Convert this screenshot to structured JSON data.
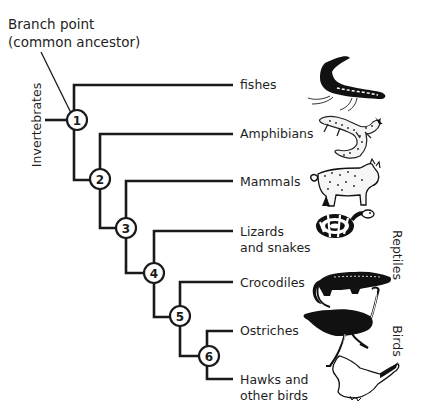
{
  "diagram": {
    "title_line1": "Branch point",
    "title_line2": "(common ancestor)",
    "root_label": "Invertebrates",
    "group_labels": {
      "reptiles": "Reptiles",
      "birds": "Birds"
    },
    "nodes": [
      "1",
      "2",
      "3",
      "4",
      "5",
      "6"
    ],
    "taxa": [
      {
        "lines": [
          "fishes"
        ],
        "icon": "fish-icon",
        "branches_from_node": "1"
      },
      {
        "lines": [
          "Amphibians"
        ],
        "icon": "salamander-icon",
        "branches_from_node": "2"
      },
      {
        "lines": [
          "Mammals"
        ],
        "icon": "wildcat-icon",
        "branches_from_node": "3"
      },
      {
        "lines": [
          "Lizards",
          "and snakes"
        ],
        "icon": "snake-icon",
        "branches_from_node": "4"
      },
      {
        "lines": [
          "Crocodiles"
        ],
        "icon": "crocodile-icon",
        "branches_from_node": "5"
      },
      {
        "lines": [
          "Ostriches"
        ],
        "icon": "ostrich-icon",
        "branches_from_node": "6"
      },
      {
        "lines": [
          "Hawks and",
          "other birds"
        ],
        "icon": "hawk-icon",
        "branches_from_node": "6"
      }
    ]
  }
}
